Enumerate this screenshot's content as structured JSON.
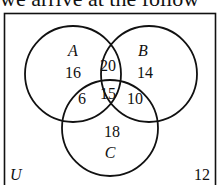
{
  "header": {
    "text": "we arrive at the follow"
  },
  "diagram": {
    "type": "venn",
    "universe_label": "U",
    "outside_value": "12",
    "sets": [
      {
        "name": "A",
        "label": "A"
      },
      {
        "name": "B",
        "label": "B"
      },
      {
        "name": "C",
        "label": "C"
      }
    ],
    "regions": {
      "A_only": "16",
      "B_only": "14",
      "C_only": "18",
      "A_and_B_only": "20",
      "A_and_C_only": "6",
      "B_and_C_only": "10",
      "A_and_B_and_C": "15"
    },
    "colors": {
      "stroke": "#111111",
      "background": "#ffffff"
    }
  }
}
